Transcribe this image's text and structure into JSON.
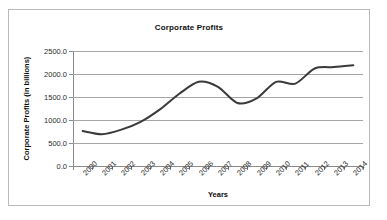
{
  "chart_data": {
    "type": "line",
    "title": "Corporate Profits",
    "xlabel": "Years",
    "ylabel": "Corporate Profits (in billions)",
    "categories": [
      "2000",
      "2001",
      "2002",
      "2003",
      "2004",
      "2005",
      "2006",
      "2007",
      "2008",
      "2009",
      "2010",
      "2011",
      "2012",
      "2013",
      "2014"
    ],
    "values": [
      760,
      690,
      790,
      960,
      1230,
      1570,
      1830,
      1720,
      1370,
      1470,
      1830,
      1790,
      2120,
      2150,
      2190
    ],
    "series": [
      {
        "name": "Corporate Profits",
        "values": [
          760,
          690,
          790,
          960,
          1230,
          1570,
          1830,
          1720,
          1370,
          1470,
          1830,
          1790,
          2120,
          2150,
          2190
        ]
      }
    ],
    "ylim": [
      0,
      2500
    ],
    "ytick_labels": [
      "0.0",
      "500.0",
      "1000.0",
      "1500.0",
      "2000.0",
      "2500.0"
    ],
    "ytick_values": [
      0,
      500,
      1000,
      1500,
      2000,
      2500
    ],
    "grid": true,
    "legend": "none",
    "line_color": "#3a3a3a",
    "gridline_color": "#a6a6a6",
    "axis_color": "#8a8a8a",
    "background_color": "#ffffff",
    "border_color": "#b9b9b9"
  }
}
